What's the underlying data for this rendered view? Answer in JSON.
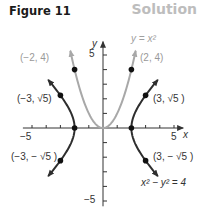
{
  "header": {
    "figure_label": "Figure 11",
    "solution_label": "Solution"
  },
  "colors": {
    "parabola": "#a8a8a8",
    "hyperbola": "#2e2e2e",
    "axis": "#333333",
    "label_gray": "#8a8a8a",
    "solution_gray": "#bdbdbd"
  },
  "chart_data": {
    "type": "line",
    "title": "",
    "xlabel": "x",
    "ylabel": "y",
    "xlim": [
      -5.5,
      5.5
    ],
    "ylim": [
      -5.5,
      5.5
    ],
    "xticks": [
      -5,
      -4,
      -3,
      -2,
      -1,
      1,
      2,
      3,
      4,
      5
    ],
    "yticks": [
      -5,
      -4,
      -3,
      -2,
      -1,
      1,
      2,
      3,
      4,
      5
    ],
    "xtick_labels": [
      {
        "value": -5,
        "text": "−5"
      },
      {
        "value": 5,
        "text": "5"
      }
    ],
    "ytick_labels": [
      {
        "value": 5,
        "text": "5"
      },
      {
        "value": -5,
        "text": "−5"
      }
    ],
    "grid": false,
    "series": [
      {
        "name": "y = x²",
        "equation_label": "y = x²",
        "kind": "parabola",
        "x_range": [
          -2.3,
          2.3
        ],
        "color": "#a8a8a8"
      },
      {
        "name": "x² − y² = 4",
        "equation_label": "x² − y² = 4",
        "kind": "hyperbola",
        "y_range": [
          -3.3,
          3.3
        ],
        "color": "#2e2e2e"
      }
    ],
    "points": [
      {
        "x": -2,
        "y": 4,
        "label": "(−2, 4)",
        "series": "parabola"
      },
      {
        "x": 2,
        "y": 4,
        "label": "(2, 4)",
        "series": "parabola"
      },
      {
        "x": -3,
        "y": 2.236,
        "label": "(−3, √5)",
        "series": "hyperbola"
      },
      {
        "x": 3,
        "y": 2.236,
        "label": "(3, √5 )",
        "series": "hyperbola"
      },
      {
        "x": -3,
        "y": -2.236,
        "label": "(−3, − √5 )",
        "series": "hyperbola"
      },
      {
        "x": 3,
        "y": -2.236,
        "label": "(3, − √5 )",
        "series": "hyperbola"
      },
      {
        "x": -2,
        "y": 0,
        "label": "",
        "series": "hyperbola"
      },
      {
        "x": 2,
        "y": 0,
        "label": "",
        "series": "hyperbola"
      }
    ]
  }
}
